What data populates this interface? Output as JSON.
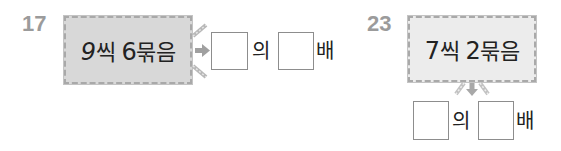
{
  "problems": [
    {
      "number": "17",
      "card": {
        "count": "9",
        "unit1": "씩 ",
        "groups": "6",
        "unit2": "묶음"
      },
      "answer": {
        "blank1": "",
        "connector": "의",
        "blank2": "",
        "suffix": "배"
      },
      "arrow_direction": "right"
    },
    {
      "number": "23",
      "card": {
        "count": "7",
        "unit1": "씩 ",
        "groups": "2",
        "unit2": "묶음"
      },
      "answer": {
        "blank1": "",
        "connector": "의",
        "blank2": "",
        "suffix": "배"
      },
      "arrow_direction": "down"
    }
  ],
  "colors": {
    "number_gray": "#9b9b9b",
    "card_dark": "#d8d8d8",
    "card_light": "#ececec",
    "arrow_gray": "#a0a0a0"
  }
}
